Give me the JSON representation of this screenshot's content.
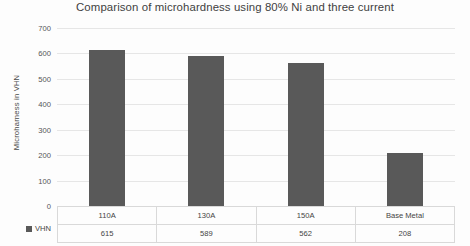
{
  "chart_data": {
    "type": "bar",
    "title": "Comparison of microhardness using 80% Ni and three current",
    "xlabel": "",
    "ylabel": "Microharness in VHN",
    "categories": [
      "110A",
      "130A",
      "150A",
      "Base Metal"
    ],
    "series": [
      {
        "name": "VHN",
        "values": [
          615,
          589,
          562,
          208
        ]
      }
    ],
    "values": [
      615,
      589,
      562,
      208
    ],
    "ylim": [
      0,
      700
    ],
    "yticks": [
      0,
      100,
      200,
      300,
      400,
      500,
      600,
      700
    ],
    "ytick_labels": [
      "0",
      "100",
      "200",
      "300",
      "400",
      "500",
      "600",
      "700"
    ],
    "grid": true,
    "legend_position": "bottom-left",
    "bar_color": "#595959",
    "gridline_color": "#e6e6e6",
    "has_data_table": true
  },
  "legend": {
    "entries": [
      {
        "label": "VHN",
        "color": "#595959"
      }
    ]
  },
  "table": {
    "row_header": "VHN",
    "header_row": [
      "110A",
      "130A",
      "150A",
      "Base Metal"
    ],
    "value_row": [
      "615",
      "589",
      "562",
      "208"
    ]
  }
}
